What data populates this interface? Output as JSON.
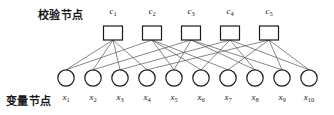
{
  "figure": {
    "type": "tanner-graph",
    "title_check_row": "校验节点",
    "title_variable_row": "变量节点",
    "background_color": "#ffffff",
    "node_stroke_color": "#1a1a1a",
    "edge_color": "#555555"
  },
  "check_nodes": [
    {
      "id": "c1",
      "label": "c",
      "sub": "1",
      "cx": 113,
      "cy": 33
    },
    {
      "id": "c2",
      "label": "c",
      "sub": "2",
      "cx": 152,
      "cy": 33
    },
    {
      "id": "c3",
      "label": "c",
      "sub": "3",
      "cx": 191,
      "cy": 33
    },
    {
      "id": "c4",
      "label": "c",
      "sub": "4",
      "cx": 230,
      "cy": 33
    },
    {
      "id": "c5",
      "label": "c",
      "sub": "5",
      "cx": 269,
      "cy": 33
    }
  ],
  "variable_nodes": [
    {
      "id": "x1",
      "label": "x",
      "sub": "1",
      "cx": 66,
      "cy": 78
    },
    {
      "id": "x2",
      "label": "x",
      "sub": "2",
      "cx": 93,
      "cy": 78
    },
    {
      "id": "x3",
      "label": "x",
      "sub": "3",
      "cx": 120,
      "cy": 78
    },
    {
      "id": "x4",
      "label": "x",
      "sub": "4",
      "cx": 147,
      "cy": 78
    },
    {
      "id": "x5",
      "label": "x",
      "sub": "5",
      "cx": 174,
      "cy": 78
    },
    {
      "id": "x6",
      "label": "x",
      "sub": "6",
      "cx": 201,
      "cy": 78
    },
    {
      "id": "x7",
      "label": "x",
      "sub": "7",
      "cx": 228,
      "cy": 78
    },
    {
      "id": "x8",
      "label": "x",
      "sub": "8",
      "cx": 255,
      "cy": 78
    },
    {
      "id": "x9",
      "label": "x",
      "sub": "9",
      "cx": 282,
      "cy": 78
    },
    {
      "id": "x10",
      "label": "x",
      "sub": "10",
      "cx": 309,
      "cy": 78
    }
  ],
  "edges": [
    {
      "check": "c1",
      "variable": "x1"
    },
    {
      "check": "c1",
      "variable": "x2"
    },
    {
      "check": "c1",
      "variable": "x3"
    },
    {
      "check": "c1",
      "variable": "x4"
    },
    {
      "check": "c2",
      "variable": "x1"
    },
    {
      "check": "c2",
      "variable": "x5"
    },
    {
      "check": "c2",
      "variable": "x6"
    },
    {
      "check": "c2",
      "variable": "x7"
    },
    {
      "check": "c3",
      "variable": "x2"
    },
    {
      "check": "c3",
      "variable": "x5"
    },
    {
      "check": "c3",
      "variable": "x8"
    },
    {
      "check": "c3",
      "variable": "x9"
    },
    {
      "check": "c4",
      "variable": "x3"
    },
    {
      "check": "c4",
      "variable": "x6"
    },
    {
      "check": "c4",
      "variable": "x8"
    },
    {
      "check": "c4",
      "variable": "x10"
    },
    {
      "check": "c5",
      "variable": "x4"
    },
    {
      "check": "c5",
      "variable": "x7"
    },
    {
      "check": "c5",
      "variable": "x9"
    },
    {
      "check": "c5",
      "variable": "x10"
    }
  ],
  "geometry": {
    "check_box_width": 19,
    "check_box_height": 14,
    "variable_radius": 8.2,
    "canvas_width": 334,
    "canvas_height": 115
  }
}
